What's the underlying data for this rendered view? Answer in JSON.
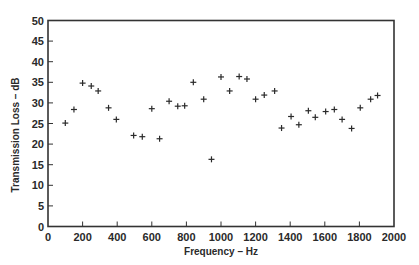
{
  "chart_data": {
    "type": "scatter",
    "title": "",
    "xlabel": "Frequency – Hz",
    "ylabel": "Transmission Loss – dB",
    "xlim": [
      0,
      2000
    ],
    "ylim": [
      0,
      50
    ],
    "x_ticks": [
      0,
      200,
      400,
      600,
      800,
      1000,
      1200,
      1400,
      1600,
      1800,
      2000
    ],
    "y_ticks": [
      0,
      5,
      10,
      15,
      20,
      25,
      30,
      35,
      40,
      45,
      50
    ],
    "grid": false,
    "legend": null,
    "marker": "+",
    "marker_color": "#2a2a2a",
    "series": [
      {
        "name": "Transmission Loss",
        "points": [
          {
            "x": 100,
            "y": 25.1
          },
          {
            "x": 150,
            "y": 28.4
          },
          {
            "x": 200,
            "y": 34.8
          },
          {
            "x": 250,
            "y": 34.1
          },
          {
            "x": 290,
            "y": 32.9
          },
          {
            "x": 350,
            "y": 28.8
          },
          {
            "x": 395,
            "y": 26.0
          },
          {
            "x": 495,
            "y": 22.1
          },
          {
            "x": 545,
            "y": 21.8
          },
          {
            "x": 600,
            "y": 28.6
          },
          {
            "x": 645,
            "y": 21.3
          },
          {
            "x": 700,
            "y": 30.4
          },
          {
            "x": 750,
            "y": 29.2
          },
          {
            "x": 790,
            "y": 29.3
          },
          {
            "x": 840,
            "y": 35.0
          },
          {
            "x": 900,
            "y": 30.9
          },
          {
            "x": 945,
            "y": 16.3
          },
          {
            "x": 1000,
            "y": 36.3
          },
          {
            "x": 1050,
            "y": 32.9
          },
          {
            "x": 1105,
            "y": 36.4
          },
          {
            "x": 1150,
            "y": 35.8
          },
          {
            "x": 1200,
            "y": 30.9
          },
          {
            "x": 1250,
            "y": 31.9
          },
          {
            "x": 1310,
            "y": 32.9
          },
          {
            "x": 1350,
            "y": 23.9
          },
          {
            "x": 1405,
            "y": 26.7
          },
          {
            "x": 1450,
            "y": 24.7
          },
          {
            "x": 1505,
            "y": 28.1
          },
          {
            "x": 1545,
            "y": 26.5
          },
          {
            "x": 1605,
            "y": 27.9
          },
          {
            "x": 1655,
            "y": 28.4
          },
          {
            "x": 1700,
            "y": 26.0
          },
          {
            "x": 1755,
            "y": 23.8
          },
          {
            "x": 1805,
            "y": 28.8
          },
          {
            "x": 1865,
            "y": 30.9
          },
          {
            "x": 1905,
            "y": 31.8
          }
        ]
      }
    ]
  },
  "layout": {
    "plot_left": 48,
    "plot_right": 394,
    "plot_top": 20.5,
    "plot_bottom": 226.5,
    "axis_color": "#333333"
  }
}
